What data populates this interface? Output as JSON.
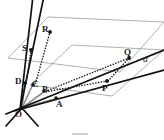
{
  "figure": {
    "type": "geometry-diagram",
    "width": 164,
    "height": 140,
    "background_color": "#ffffff",
    "plane_outline_color": "#9a9a9a",
    "solid_line_color": "#111111",
    "dotted_line_color": "#1a1a1a",
    "gray_ray_color": "#8c8c8c",
    "label_color": "#1a1a1a",
    "point_marker_color": "#111111"
  },
  "labels": {
    "O": "O",
    "A": "A",
    "B": "B",
    "C": "C",
    "D": "D",
    "P": "P",
    "Q": "Q",
    "R": "R",
    "S": "S",
    "alpha": "α"
  },
  "points": [
    {
      "name": "O",
      "label": "O",
      "x": 22,
      "y": 108,
      "label_x": 18,
      "label_y": 110,
      "marker": true
    },
    {
      "name": "A",
      "label": "A",
      "x": 55,
      "y": 99,
      "label_x": 56,
      "label_y": 100,
      "marker": true
    },
    {
      "name": "B",
      "label": "B",
      "x": 43,
      "y": 92,
      "label_x": 42,
      "label_y": 87,
      "marker": true
    },
    {
      "name": "C",
      "label": "C",
      "x": 32,
      "y": 86,
      "label_x": 32,
      "label_y": 82,
      "marker": true
    },
    {
      "name": "D",
      "label": "D",
      "x": 24,
      "y": 84,
      "label_x": 16,
      "label_y": 79,
      "marker": true
    },
    {
      "name": "P",
      "label": "P",
      "x": 107,
      "y": 81,
      "label_x": 103,
      "label_y": 85,
      "marker": true
    },
    {
      "name": "Q",
      "label": "Q",
      "x": 129,
      "y": 58,
      "label_x": 124,
      "label_y": 49,
      "marker": true
    },
    {
      "name": "R",
      "label": "R",
      "x": 50,
      "y": 32,
      "label_x": 42,
      "label_y": 27,
      "marker": true
    },
    {
      "name": "S",
      "label": "S",
      "x": 31,
      "y": 50,
      "label_x": 23,
      "label_y": 46,
      "marker": true
    },
    {
      "name": "alpha",
      "label": "α",
      "x": 145,
      "y": 60,
      "label_x": 143,
      "label_y": 57,
      "marker": false
    }
  ],
  "planes": [
    {
      "name": "upper-plane",
      "vertices": "8,58 48,17 164,22 120,72"
    },
    {
      "name": "lower-plane-alpha",
      "vertices": "30,85 72,45 164,50 112,96"
    }
  ],
  "solid_lines": [
    {
      "name": "line-O-R-extended",
      "x1": 20,
      "y1": 110,
      "x2": 44,
      "y2": -4
    },
    {
      "name": "line-O-S-extended",
      "x1": 20,
      "y1": 110,
      "x2": 33,
      "y2": -4
    },
    {
      "name": "line-O-P-extended",
      "x1": 14,
      "y1": 111,
      "x2": 164,
      "y2": 70
    },
    {
      "name": "line-O-Q-extended",
      "x1": 6,
      "y1": 114,
      "x2": 164,
      "y2": 50
    },
    {
      "name": "line-O-down-left",
      "x1": 22,
      "y1": 108,
      "x2": 6,
      "y2": 126
    },
    {
      "name": "line-O-down-right",
      "x1": 22,
      "y1": 108,
      "x2": 38,
      "y2": 126
    }
  ],
  "gray_rays": [
    {
      "name": "ray-O-A",
      "x1": 22,
      "y1": 108,
      "x2": 58,
      "y2": 98
    },
    {
      "name": "ray-O-B",
      "x1": 22,
      "y1": 108,
      "x2": 45,
      "y2": 91
    },
    {
      "name": "ray-O-C",
      "x1": 22,
      "y1": 108,
      "x2": 33,
      "y2": 84
    },
    {
      "name": "ray-O-D",
      "x1": 22,
      "y1": 108,
      "x2": 25,
      "y2": 82
    }
  ],
  "dotted_lines": [
    {
      "name": "dotted-S-D",
      "x1": 31,
      "y1": 50,
      "x2": 26,
      "y2": 84
    },
    {
      "name": "dotted-R-C",
      "x1": 50,
      "y1": 32,
      "x2": 35,
      "y2": 85
    },
    {
      "name": "dotted-Q-P",
      "x1": 129,
      "y1": 58,
      "x2": 108,
      "y2": 81
    },
    {
      "name": "dotted-P-B",
      "x1": 107,
      "y1": 81,
      "x2": 44,
      "y2": 92
    },
    {
      "name": "dotted-Q-B",
      "x1": 129,
      "y1": 58,
      "x2": 45,
      "y2": 91
    }
  ],
  "caption": {
    "mark_visible": true
  }
}
